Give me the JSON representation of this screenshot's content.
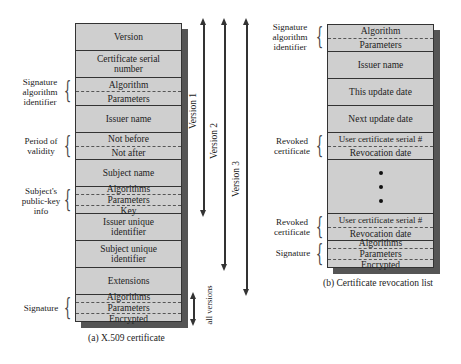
{
  "x509": {
    "caption": "(a) X.509 certificate",
    "fields": {
      "version": "Version",
      "serial": "Certificate serial number",
      "sig_alg": {
        "algorithm": "Algorithm",
        "parameters": "Parameters"
      },
      "issuer": "Issuer name",
      "validity": {
        "not_before": "Not before",
        "not_after": "Not after"
      },
      "subject": "Subject name",
      "pubkey": {
        "algorithms": "Algorithms",
        "parameters": "Parameters",
        "key": "Key"
      },
      "issuer_uid": "Issuer unique identifier",
      "subject_uid": "Subject unique identifier",
      "extensions": "Extensions",
      "signature": {
        "algorithms": "Algorithms",
        "parameters": "Parameters",
        "encrypted": "Encrypted"
      }
    },
    "side_labels": {
      "sig_alg_id": "Signature algorithm identifier",
      "validity": "Period of validity",
      "pubkey": "Subject's public-key info",
      "signature": "Signature"
    },
    "version_arrows": [
      "Version 1",
      "Version 2",
      "Version 3"
    ],
    "all_versions": "all versions"
  },
  "crl": {
    "caption": "(b) Certificate revocation list",
    "fields": {
      "sig_alg": {
        "algorithm": "Algorithm",
        "parameters": "Parameters"
      },
      "issuer": "Issuer name",
      "this_update": "This update date",
      "next_update": "Next update date",
      "revoked1": {
        "serial": "User certificate serial #",
        "date": "Revocation date"
      },
      "revoked2": {
        "serial": "User certificate serial #",
        "date": "Revocation date"
      },
      "signature": {
        "algorithms": "Algorithms",
        "parameters": "Parameters",
        "encrypted": "Encrypted"
      }
    },
    "side_labels": {
      "sig_alg_id": "Signature algorithm identifier",
      "revoked1": "Revoked certificate",
      "revoked2": "Revoked certificate",
      "signature": "Signature"
    }
  }
}
